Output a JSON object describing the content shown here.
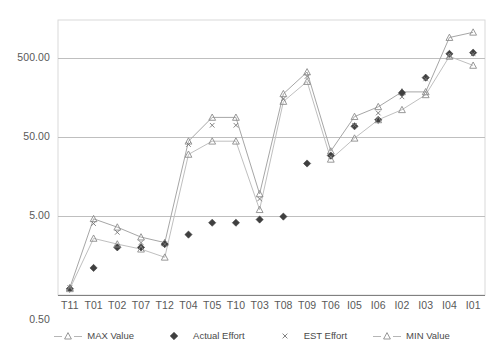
{
  "chart_data": {
    "type": "line",
    "title": "",
    "subtitle": "",
    "xlabel": "",
    "ylabel": "",
    "yscale": "log",
    "ylim": [
      0.5,
      1500
    ],
    "yticks": [
      0.5,
      5.0,
      50.0,
      500.0
    ],
    "ytick_labels": [
      "0.50",
      "5.00",
      "50.00",
      "500.00"
    ],
    "grid": true,
    "grid_axis": "y",
    "legend_position": "bottom",
    "categories": [
      "T11",
      "T01",
      "T02",
      "T07",
      "T12",
      "T04",
      "T05",
      "T10",
      "T03",
      "T08",
      "T09",
      "T06",
      "I05",
      "I06",
      "I02",
      "I03",
      "I04",
      "I01"
    ],
    "series": [
      {
        "name": "MAX Value",
        "marker": "triangle-open",
        "line": true,
        "color": "#a6a6a6",
        "values": [
          0.62,
          4.6,
          3.6,
          2.7,
          2.3,
          44.0,
          88.0,
          88.0,
          9.5,
          175.0,
          330.0,
          33.0,
          90.0,
          120.0,
          185.0,
          185.0,
          900.0,
          1050.0
        ]
      },
      {
        "name": "Actual Effort",
        "marker": "diamond-filled",
        "line": false,
        "color": "#404040",
        "values": [
          0.6,
          1.1,
          2.0,
          2.0,
          2.2,
          2.9,
          4.1,
          4.1,
          4.5,
          4.9,
          23.0,
          29.0,
          68.0,
          82.0,
          180.0,
          280.0,
          560.0,
          580.0
        ]
      },
      {
        "name": "EST Effort",
        "marker": "x",
        "line": false,
        "color": "#6f6f6f",
        "values": [
          0.62,
          4.0,
          3.1,
          2.3,
          2.2,
          40.0,
          70.0,
          70.0,
          8.2,
          150.0,
          290.0,
          28.0,
          70.0,
          100.0,
          160.0,
          270.0,
          530.0,
          560.0
        ]
      },
      {
        "name": "MIN Value",
        "marker": "triangle-open",
        "line": true,
        "color": "#bfbfbf",
        "values": [
          0.6,
          2.6,
          2.2,
          1.9,
          1.5,
          30.0,
          44.0,
          44.0,
          6.0,
          140.0,
          250.0,
          26.0,
          48.0,
          82.0,
          110.0,
          170.0,
          520.0,
          400.0
        ]
      }
    ],
    "legend": [
      {
        "label": "MAX Value",
        "marker": "triangle-open",
        "line": true
      },
      {
        "label": "Actual Effort",
        "marker": "diamond-filled",
        "line": false
      },
      {
        "label": "EST Effort",
        "marker": "x",
        "line": false
      },
      {
        "label": "MIN Value",
        "marker": "triangle-open",
        "line": true
      }
    ],
    "colors": {
      "plot_border": "#d9d9d9",
      "gridline": "#bfbfbf",
      "axis_line": "#808080",
      "max_line": "#b3b3b3",
      "min_line": "#c6c6c6",
      "actual_marker": "#3f3f3f",
      "est_marker": "#767676",
      "tri_marker": "#8c8c8c",
      "text": "#595959"
    }
  }
}
